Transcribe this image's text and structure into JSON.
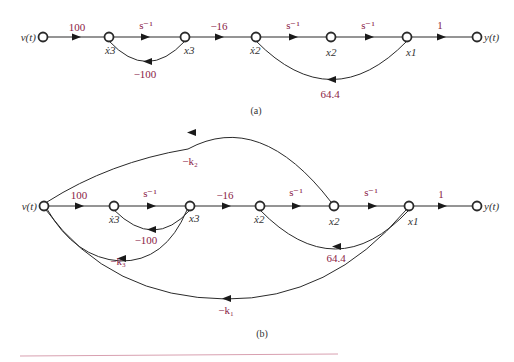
{
  "diagrams": [
    {
      "id": "a",
      "caption": "(a)",
      "nodes": [
        {
          "id": "v",
          "label": "v(t)"
        },
        {
          "id": "x3dot",
          "label": "ẋ3"
        },
        {
          "id": "x3",
          "label": "x3"
        },
        {
          "id": "x2dot",
          "label": "ẋ2"
        },
        {
          "id": "x2",
          "label": "x2"
        },
        {
          "id": "x1",
          "label": "x1"
        },
        {
          "id": "y",
          "label": "y(t)"
        }
      ],
      "gains": {
        "v_x3dot": "100",
        "x3dot_x3": "s⁻¹",
        "x3_x3dot": "−100",
        "x3_x2dot": "−16",
        "x2dot_x2": "s⁻¹",
        "x2_x1": "s⁻¹",
        "x1_x2dot": "64.4",
        "x1_y": "1"
      }
    },
    {
      "id": "b",
      "caption": "(b)",
      "nodes": [
        {
          "id": "v",
          "label": "v(t)"
        },
        {
          "id": "x3dot",
          "label": "ẋ3"
        },
        {
          "id": "x3",
          "label": "x3"
        },
        {
          "id": "x2dot",
          "label": "ẋ2"
        },
        {
          "id": "x2",
          "label": "x2"
        },
        {
          "id": "x1",
          "label": "x1"
        },
        {
          "id": "y",
          "label": "y(t)"
        }
      ],
      "gains": {
        "v_x3dot": "100",
        "x3dot_x3": "s⁻¹",
        "x3_x3dot": "−100",
        "x3_x2dot": "−16",
        "x2dot_x2": "s⁻¹",
        "x2_x1": "s⁻¹",
        "x1_x2dot": "64.4",
        "x1_y": "1",
        "x2_v": "−k₂",
        "x3_v": "−k₃",
        "x1_v": "−k₁"
      }
    }
  ]
}
